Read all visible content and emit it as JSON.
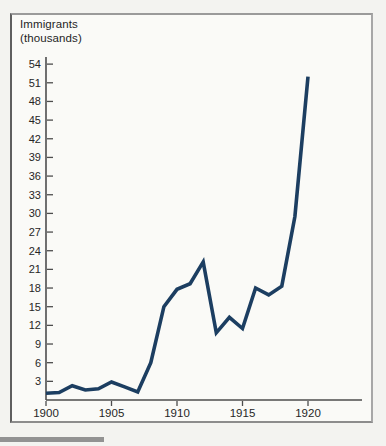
{
  "figure": {
    "background": "#fafaf7",
    "border_color": "#8c8c8c",
    "page_background": "#f3f3f0"
  },
  "chart_data": {
    "type": "line",
    "title": "Immigrants",
    "subtitle": "(thousands)",
    "xlabel": "",
    "ylabel": "Immigrants (thousands)",
    "x": [
      1900,
      1901,
      1902,
      1903,
      1904,
      1905,
      1906,
      1907,
      1908,
      1909,
      1910,
      1911,
      1912,
      1913,
      1914,
      1915,
      1916,
      1917,
      1918,
      1919,
      1920
    ],
    "series": [
      {
        "name": "Immigrants (thousands)",
        "values": [
          1.1,
          1.2,
          2.3,
          1.6,
          1.8,
          2.9,
          2.1,
          1.3,
          6.0,
          15.0,
          17.8,
          18.7,
          22.2,
          10.8,
          13.3,
          11.5,
          18.0,
          16.9,
          18.3,
          29.5,
          52.0
        ]
      }
    ],
    "xticks": [
      1900,
      1905,
      1910,
      1915,
      1920
    ],
    "yticks": [
      3,
      6,
      9,
      12,
      15,
      18,
      21,
      24,
      27,
      30,
      33,
      36,
      39,
      42,
      45,
      48,
      51,
      54
    ],
    "xlim": [
      1900,
      1924
    ],
    "ylim": [
      0,
      55
    ],
    "grid": false,
    "legend_position": "none",
    "line_color": "#1c3e61",
    "axis_color": "#4d4d4d",
    "label_color": "#262626"
  }
}
